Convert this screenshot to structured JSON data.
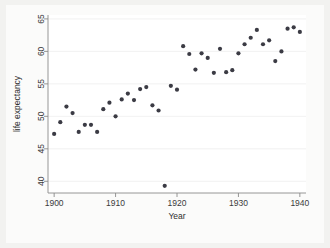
{
  "chart_data": {
    "type": "scatter",
    "title": "",
    "subtitle": "",
    "xlabel": "Year",
    "ylabel": "life expectancy",
    "xlim": [
      1899,
      1941
    ],
    "ylim": [
      38.2,
      65.6
    ],
    "xticks": [
      1900,
      1910,
      1920,
      1930,
      1940
    ],
    "xtick_labels": [
      "1900",
      "1910",
      "1920",
      "1930",
      "1940"
    ],
    "yticks": [
      40,
      45,
      50,
      55,
      60,
      65
    ],
    "ytick_labels": [
      "40",
      "45",
      "50",
      "55",
      "60",
      "65"
    ],
    "grid": "horizontal",
    "legend": "none",
    "marker_color": "#3b3b44",
    "marker_shape": "circle",
    "plot_background": "#ffffff",
    "figure_background": "#f2f2f0",
    "series": [
      {
        "name": "life expectancy",
        "points": [
          {
            "x": 1900,
            "y": 47.3
          },
          {
            "x": 1901,
            "y": 49.1
          },
          {
            "x": 1902,
            "y": 51.5
          },
          {
            "x": 1903,
            "y": 50.5
          },
          {
            "x": 1904,
            "y": 47.6
          },
          {
            "x": 1905,
            "y": 48.7
          },
          {
            "x": 1906,
            "y": 48.7
          },
          {
            "x": 1907,
            "y": 47.6
          },
          {
            "x": 1908,
            "y": 51.1
          },
          {
            "x": 1909,
            "y": 52.1
          },
          {
            "x": 1910,
            "y": 50.0
          },
          {
            "x": 1911,
            "y": 52.6
          },
          {
            "x": 1912,
            "y": 53.5
          },
          {
            "x": 1913,
            "y": 52.5
          },
          {
            "x": 1914,
            "y": 54.2
          },
          {
            "x": 1915,
            "y": 54.5
          },
          {
            "x": 1916,
            "y": 51.7
          },
          {
            "x": 1917,
            "y": 50.9
          },
          {
            "x": 1918,
            "y": 39.3
          },
          {
            "x": 1919,
            "y": 54.7
          },
          {
            "x": 1920,
            "y": 54.1
          },
          {
            "x": 1921,
            "y": 60.8
          },
          {
            "x": 1922,
            "y": 59.6
          },
          {
            "x": 1923,
            "y": 57.2
          },
          {
            "x": 1924,
            "y": 59.7
          },
          {
            "x": 1925,
            "y": 59.0
          },
          {
            "x": 1926,
            "y": 56.7
          },
          {
            "x": 1927,
            "y": 60.4
          },
          {
            "x": 1928,
            "y": 56.8
          },
          {
            "x": 1929,
            "y": 57.1
          },
          {
            "x": 1930,
            "y": 59.7
          },
          {
            "x": 1931,
            "y": 61.1
          },
          {
            "x": 1932,
            "y": 62.1
          },
          {
            "x": 1933,
            "y": 63.3
          },
          {
            "x": 1934,
            "y": 61.1
          },
          {
            "x": 1935,
            "y": 61.7
          },
          {
            "x": 1936,
            "y": 58.5
          },
          {
            "x": 1937,
            "y": 60.0
          },
          {
            "x": 1938,
            "y": 63.5
          },
          {
            "x": 1939,
            "y": 63.7
          },
          {
            "x": 1940,
            "y": 63.0
          }
        ]
      }
    ]
  }
}
